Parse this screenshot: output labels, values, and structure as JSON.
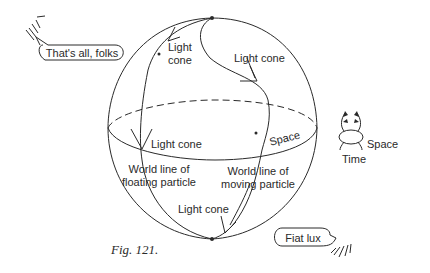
{
  "figure": {
    "caption": "Fig. 121.",
    "stroke_color": "#2a2a2a",
    "background_color": "#ffffff"
  },
  "labels": {
    "light_cone_top_left": [
      "Light",
      "cone"
    ],
    "light_cone_top_right": "Light cone",
    "light_cone_equator": "Light cone",
    "light_cone_bottom": "Light cone",
    "space_equator": "Space",
    "world_line_floating": [
      "World line of",
      "floating particle"
    ],
    "world_line_moving": [
      "World line of",
      "moving particle"
    ]
  },
  "legend": {
    "space": "Space",
    "time": "Time"
  },
  "speech_bubbles": {
    "end": "That's all, folks",
    "beginning": "Fiat lux"
  }
}
